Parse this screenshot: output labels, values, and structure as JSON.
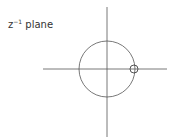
{
  "diagram": {
    "title_base": "z",
    "title_sup": "−1",
    "title_rest": " plane",
    "stroke_color": "#555555"
  }
}
